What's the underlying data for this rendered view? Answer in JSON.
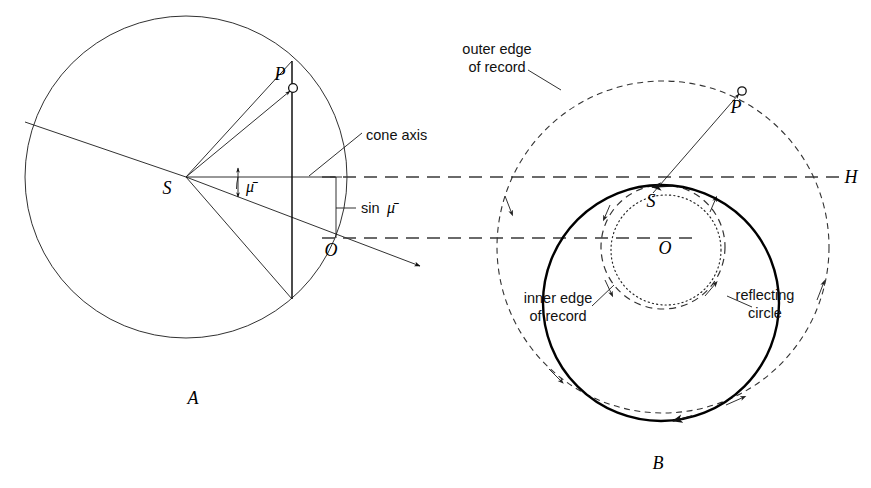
{
  "figure": {
    "background": "#ffffff",
    "ink": "#111111",
    "width": 871,
    "height": 488
  },
  "panels": [
    {
      "id": "A",
      "caption": "A",
      "caption_pos": {
        "x": 193,
        "y": 404
      },
      "description": "Reflection sphere section with cone axis and sin mu-bar construction",
      "points": [
        {
          "name": "S",
          "label": "S",
          "x": 186,
          "y": 177,
          "label_x": 167,
          "label_y": 194
        },
        {
          "name": "P",
          "label": "P",
          "x": 293,
          "y": 88,
          "label_x": 280,
          "label_y": 80
        },
        {
          "name": "O",
          "label": "O",
          "x": 334,
          "y": 238,
          "label_x": 331,
          "label_y": 256
        }
      ],
      "circle": {
        "cx": 186,
        "cy": 177,
        "r": 161
      },
      "annotations": [
        {
          "name": "cone-axis",
          "text": "cone axis",
          "x": 366,
          "y": 140
        },
        {
          "name": "sin-mu-bar",
          "text": "sin",
          "symbol": "μ̄",
          "x": 359,
          "y": 210
        },
        {
          "name": "mu-bar-angle",
          "symbol": "μ̄",
          "x": 243,
          "y": 190
        }
      ]
    },
    {
      "id": "B",
      "caption": "B",
      "caption_pos": {
        "x": 658,
        "y": 469
      },
      "description": "Plan view of record: outer edge, inner edge, reflecting circle and H axis",
      "points": [
        {
          "name": "S",
          "label": "S",
          "x": 661,
          "y": 185,
          "label_x": 651,
          "label_y": 205
        },
        {
          "name": "P",
          "label": "P",
          "x": 742,
          "y": 91,
          "label_x": 734,
          "label_y": 113
        },
        {
          "name": "O",
          "label": "O",
          "x": 663,
          "y": 247,
          "label_x": 657,
          "label_y": 253
        }
      ],
      "reflecting_circle": {
        "cx": 661,
        "cy": 185,
        "r": 118,
        "shift_y": 118
      },
      "outer_edge_circle": {
        "cx": 663,
        "cy": 247,
        "r": 166
      },
      "inner_edge_circle": {
        "cx": 663,
        "cy": 247,
        "r": 62
      },
      "dotted_circle": {
        "cx": 666,
        "cy": 250,
        "r": 55
      },
      "annotations": [
        {
          "name": "outer-edge-of-record",
          "line1": "outer edge",
          "line2": "of record",
          "x": 484,
          "y": 56
        },
        {
          "name": "inner-edge-of-record",
          "line1": "inner edge",
          "line2": "of record",
          "x": 559,
          "y": 303
        },
        {
          "name": "reflecting-circle",
          "line1": "reflecting",
          "line2": "circle",
          "x": 763,
          "y": 303
        },
        {
          "name": "axis-H",
          "text": "H",
          "x": 851,
          "y": 180
        }
      ]
    }
  ],
  "symbols": {
    "mu_bar": "μ̄",
    "sin": "sin"
  }
}
